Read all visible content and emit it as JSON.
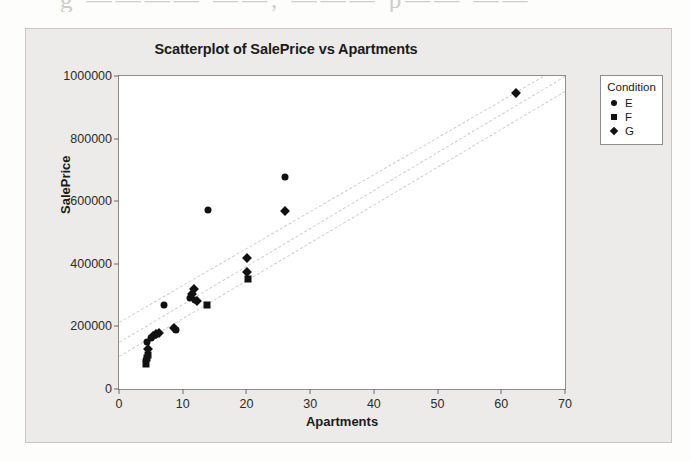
{
  "scan": {
    "top_text_fragment": "g ———— ——, ——— p—— ——",
    "right_text_fragment": ""
  },
  "chart_data": {
    "type": "scatter",
    "title": "Scatterplot of SalePrice vs Apartments",
    "xlabel": "Apartments",
    "ylabel": "SalePrice",
    "xlim": [
      0,
      70
    ],
    "ylim": [
      0,
      1000000
    ],
    "xticks": [
      0,
      10,
      20,
      30,
      40,
      50,
      60,
      70
    ],
    "xtick_labels": [
      "0",
      "10",
      "20",
      "30",
      "40",
      "50",
      "60",
      "70"
    ],
    "yticks": [
      0,
      200000,
      400000,
      600000,
      800000,
      1000000
    ],
    "ytick_labels": [
      "0",
      "200000",
      "400000",
      "600000",
      "800000",
      "1000000"
    ],
    "grid": false,
    "legend": {
      "title": "Condition",
      "position": "right-outside",
      "entries": [
        {
          "label": "E",
          "marker": "circle"
        },
        {
          "label": "F",
          "marker": "square"
        },
        {
          "label": "G",
          "marker": "diamond"
        }
      ]
    },
    "series": [
      {
        "name": "E",
        "marker": "circle",
        "points": [
          {
            "x": 4.3,
            "y": 92000
          },
          {
            "x": 4.4,
            "y": 150000
          },
          {
            "x": 5.0,
            "y": 163000
          },
          {
            "x": 5.6,
            "y": 172000
          },
          {
            "x": 7.0,
            "y": 268000
          },
          {
            "x": 9.0,
            "y": 190000
          },
          {
            "x": 11.2,
            "y": 290000
          },
          {
            "x": 12.0,
            "y": 283000
          },
          {
            "x": 14.0,
            "y": 573000
          },
          {
            "x": 26.0,
            "y": 678000
          }
        ]
      },
      {
        "name": "F",
        "marker": "square",
        "points": [
          {
            "x": 4.3,
            "y": 80000
          },
          {
            "x": 4.4,
            "y": 98000
          },
          {
            "x": 4.5,
            "y": 110000
          },
          {
            "x": 13.8,
            "y": 268000
          },
          {
            "x": 20.2,
            "y": 352000
          }
        ]
      },
      {
        "name": "G",
        "marker": "diamond",
        "points": [
          {
            "x": 4.6,
            "y": 128000
          },
          {
            "x": 5.3,
            "y": 168000
          },
          {
            "x": 5.8,
            "y": 176000
          },
          {
            "x": 6.3,
            "y": 180000
          },
          {
            "x": 8.6,
            "y": 196000
          },
          {
            "x": 11.4,
            "y": 302000
          },
          {
            "x": 11.8,
            "y": 320000
          },
          {
            "x": 12.3,
            "y": 282000
          },
          {
            "x": 20.1,
            "y": 420000
          },
          {
            "x": 20.1,
            "y": 375000
          },
          {
            "x": 26.1,
            "y": 570000
          },
          {
            "x": 62.3,
            "y": 945000
          }
        ]
      }
    ],
    "reference_lines": [
      {
        "name": "upper-band",
        "style": "dashed",
        "color": "#cfcfcf",
        "x0": 0,
        "y0": 215000,
        "x1": 66.5,
        "y1": 1000000
      },
      {
        "name": "fit-line",
        "style": "dashed",
        "color": "#cfcfcf",
        "x0": 0,
        "y0": 150000,
        "x1": 70.0,
        "y1": 1000000
      },
      {
        "name": "lower-band",
        "style": "dashed",
        "color": "#cfcfcf",
        "x0": 0,
        "y0": 105000,
        "x1": 70.0,
        "y1": 952000
      }
    ],
    "colors": {
      "marker": "#111111",
      "reference_line": "#cfcfcf",
      "plot_background": "#ffffff",
      "figure_background": "#ecebe9",
      "axis": "#8d8d8d"
    }
  }
}
